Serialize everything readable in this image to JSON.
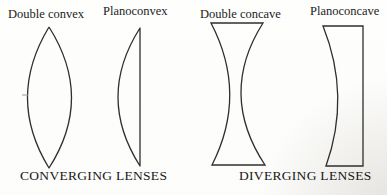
{
  "diagram": {
    "labels": {
      "double_convex": "Double convex",
      "planoconvex": "Planoconvex",
      "double_concave": "Double concave",
      "planoconcave": "Planoconcave"
    },
    "groups": {
      "converging": "CONVERGING LENSES",
      "diverging": "DIVERGING LENSES"
    },
    "colors": {
      "ink": "#2f2f2f",
      "text": "#1c1c1c",
      "background": "#fdfdfc",
      "tick": "#9a9a9a"
    },
    "shapes": [
      "double-convex-lens-shape",
      "planoconvex-lens-shape",
      "double-concave-lens-shape",
      "planoconcave-lens-shape"
    ]
  }
}
